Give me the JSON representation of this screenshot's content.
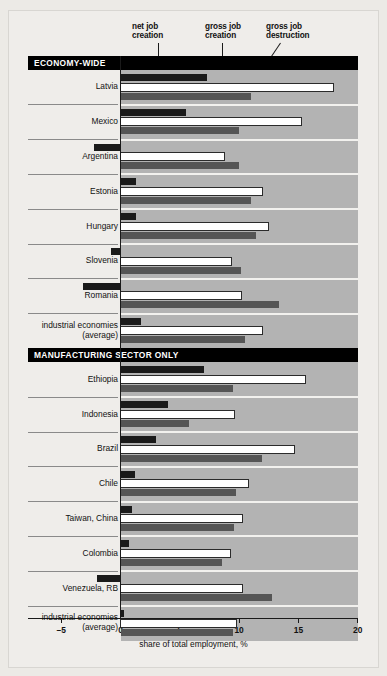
{
  "legend": [
    {
      "id": "net-job-creation",
      "label": "net job\ncreation",
      "line1": "net job",
      "line2": "creation"
    },
    {
      "id": "gross-job-creation",
      "label": "gross job\ncreation",
      "line1": "gross job",
      "line2": "creation"
    },
    {
      "id": "gross-job-destruction",
      "label": "gross job\ndestruction",
      "line1": "gross job",
      "line2": "destruction"
    }
  ],
  "sections": [
    {
      "id": "economy-wide",
      "title": "ECONOMY-WIDE"
    },
    {
      "id": "manufacturing-sector-only",
      "title": "MANUFACTURING SECTOR ONLY"
    }
  ],
  "axis": {
    "title": "share of total employment, %",
    "ticks": [
      "–5",
      "0",
      "5",
      "10",
      "15",
      "20"
    ],
    "min": -5,
    "max": 20
  },
  "colors": {
    "net_job_creation": "#1a1a1a",
    "gross_job_creation": "#ffffff",
    "gross_job_destruction": "#555555",
    "plot_background": "#b3b3b3",
    "section_header": "#000000",
    "page_background": "#efedea"
  },
  "chart_data": {
    "type": "bar",
    "title": "",
    "subtitle": "",
    "xlabel": "share of total employment, %",
    "ylabel": "",
    "xlim": [
      -5,
      20
    ],
    "xticks": [
      -5,
      0,
      5,
      10,
      15,
      20
    ],
    "grid": false,
    "legend_position": "top",
    "orientation": "horizontal",
    "series": [
      {
        "name": "net job creation",
        "key": "net"
      },
      {
        "name": "gross job creation",
        "key": "create"
      },
      {
        "name": "gross job destruction",
        "key": "destroy"
      }
    ],
    "groups": [
      {
        "section": "ECONOMY-WIDE",
        "categories": [
          "Latvia",
          "Mexico",
          "Argentina",
          "Estonia",
          "Hungary",
          "Slovenia",
          "Romania",
          "industrial economies\n(average)"
        ],
        "values": {
          "net": [
            7.3,
            5.5,
            -2.2,
            1.3,
            1.3,
            -0.8,
            -3.2,
            1.7
          ],
          "create": [
            18.0,
            15.3,
            8.8,
            12.0,
            12.5,
            9.4,
            10.2,
            12.0
          ],
          "destroy": [
            11.0,
            10.0,
            10.0,
            11.0,
            11.4,
            10.2,
            13.4,
            10.5
          ]
        }
      },
      {
        "section": "MANUFACTURING SECTOR ONLY",
        "categories": [
          "Ethiopia",
          "Indonesia",
          "Brazil",
          "Chile",
          "Taiwan, China",
          "Colombia",
          "Venezuela, RB",
          "industrial economies\n(average)"
        ],
        "values": {
          "net": [
            7.0,
            4.0,
            3.0,
            1.2,
            1.0,
            0.7,
            -2.0,
            0.3
          ],
          "create": [
            15.6,
            9.6,
            14.7,
            10.8,
            10.3,
            9.3,
            10.3,
            9.8
          ],
          "destroy": [
            9.5,
            5.8,
            11.9,
            9.7,
            9.6,
            8.6,
            12.8,
            9.5
          ]
        }
      }
    ]
  }
}
